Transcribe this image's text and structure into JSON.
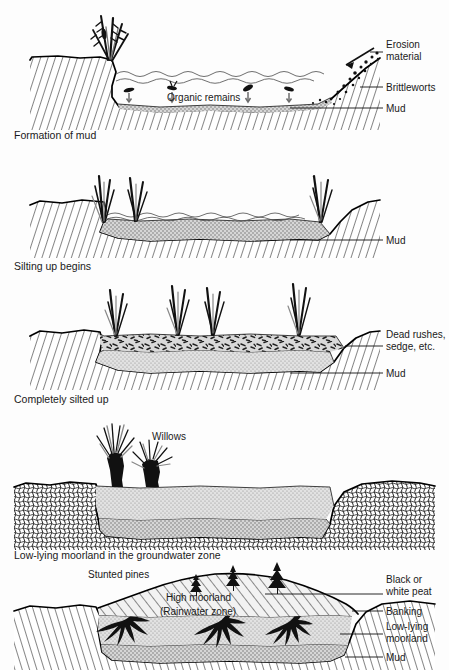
{
  "figure": {
    "background_color": "#fdfdfd",
    "ink_color": "#111111"
  },
  "panels": [
    {
      "id": "panel-1",
      "caption": "Formation of mud",
      "inline_labels": [
        {
          "name": "organic-remains",
          "text": "Organic remains"
        }
      ],
      "right_labels": [
        {
          "name": "erosion-material",
          "line1": "Erosion",
          "line2": "material"
        },
        {
          "name": "brittleworts",
          "line1": "Brittleworts",
          "line2": ""
        },
        {
          "name": "mud",
          "line1": "Mud",
          "line2": ""
        }
      ]
    },
    {
      "id": "panel-2",
      "caption": "Silting up begins",
      "inline_labels": [],
      "right_labels": [
        {
          "name": "mud",
          "line1": "Mud",
          "line2": ""
        }
      ]
    },
    {
      "id": "panel-3",
      "caption": "Completely silted up",
      "inline_labels": [],
      "right_labels": [
        {
          "name": "dead-rushes-sedge",
          "line1": "Dead rushes,",
          "line2": "sedge, etc."
        },
        {
          "name": "mud",
          "line1": "Mud",
          "line2": ""
        }
      ]
    },
    {
      "id": "panel-4",
      "caption": "Low-lying moorland in the groundwater zone",
      "inline_labels": [
        {
          "name": "willows",
          "text": "Willows"
        }
      ],
      "right_labels": []
    },
    {
      "id": "panel-5",
      "caption": "",
      "inline_labels": [
        {
          "name": "stunted-pines",
          "text": "Stunted pines"
        },
        {
          "name": "high-moorland",
          "text": "High moorland"
        },
        {
          "name": "rainwater-zone",
          "text": "(Rainwater zone)"
        }
      ],
      "right_labels": [
        {
          "name": "black-or-white-peat",
          "line1": "Black or",
          "line2": "white peat"
        },
        {
          "name": "banking",
          "line1": "Banking",
          "line2": ""
        },
        {
          "name": "low-lying-moorland",
          "line1": "Low-lying",
          "line2": "moorland"
        },
        {
          "name": "mud",
          "line1": "Mud",
          "line2": ""
        }
      ]
    }
  ],
  "colors": {
    "mud_fill": "#c9c9c9",
    "peat_fill": "#efefef",
    "water_fill": "#ffffff",
    "bedrock_stroke": "#2a2a2a",
    "text": "#111111"
  }
}
